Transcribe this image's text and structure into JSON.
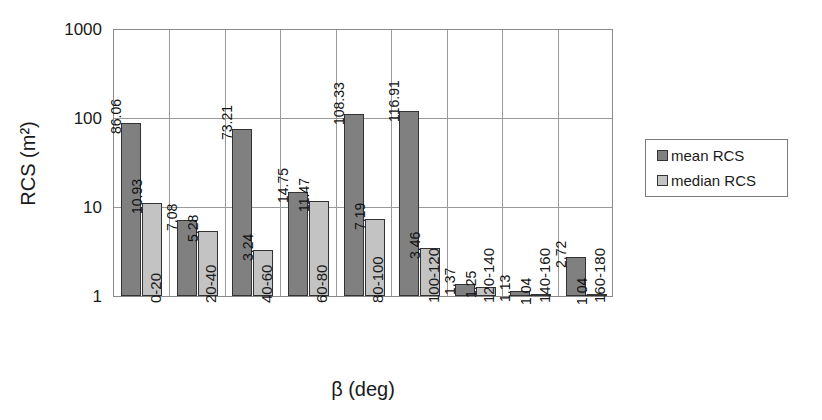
{
  "chart_data": {
    "type": "bar",
    "title": "",
    "xlabel": "β (deg)",
    "ylabel": "RCS (m²)",
    "yscale": "log",
    "ylim": [
      1,
      1000
    ],
    "yticks": [
      "1",
      "10",
      "100",
      "1000"
    ],
    "ytick_values": [
      1,
      10,
      100,
      1000
    ],
    "grid": true,
    "legend_position": "right",
    "categories": [
      "0-20",
      "20-40",
      "40-60",
      "60-80",
      "80-100",
      "100-120",
      "120-140",
      "140-160",
      "160-180"
    ],
    "series": [
      {
        "name": "mean RCS",
        "color": "#808080",
        "values": [
          86.06,
          7.08,
          73.21,
          14.75,
          108.33,
          116.91,
          1.37,
          1.13,
          2.72
        ],
        "labels": [
          "86.06",
          "7.08",
          "73.21",
          "14.75",
          "108.33",
          "116.91",
          "1.37",
          "1.13",
          "2.72"
        ]
      },
      {
        "name": "median RCS",
        "color": "#c3c3c3",
        "values": [
          10.93,
          5.28,
          3.24,
          11.47,
          7.19,
          3.46,
          1.25,
          1.04,
          1.04
        ],
        "labels": [
          "10.93",
          "5.28",
          "3.24",
          "11.47",
          "7.19",
          "3.46",
          "1.25",
          "1.04",
          "1.04"
        ]
      }
    ]
  },
  "legend": {
    "entries": [
      {
        "label": "mean RCS",
        "swatch": "mean"
      },
      {
        "label": "median RCS",
        "swatch": "median"
      }
    ]
  }
}
